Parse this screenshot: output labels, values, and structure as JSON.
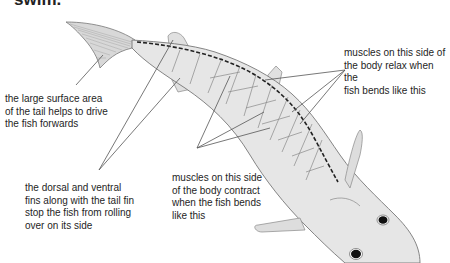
{
  "heading": "swim.",
  "labels": {
    "tail": [
      "the large surface area",
      "of the tail helps to drive",
      "the fish forwards"
    ],
    "relax": [
      "muscles on this side of",
      "the body relax when the",
      "fish bends like this"
    ],
    "fins": [
      "the dorsal and ventral",
      "fins along with the tail fin",
      "stop the fish from rolling",
      "over on its side"
    ],
    "contract": [
      "muscles on this side",
      "of the body contract",
      "when the fish bends",
      "like this"
    ]
  },
  "colors": {
    "body_fill": "#e6e6e6",
    "outline": "#777777",
    "leader_line": "#555555",
    "spine": "#222222",
    "eye": "#111111"
  }
}
